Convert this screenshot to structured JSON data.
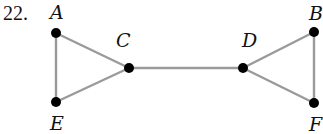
{
  "problem_number": "22.",
  "graph": {
    "nodes": [
      {
        "id": "A",
        "label": "A",
        "x": 56,
        "y": 33,
        "lx": 50,
        "ly": 19
      },
      {
        "id": "E",
        "label": "E",
        "x": 56,
        "y": 102,
        "lx": 50,
        "ly": 130
      },
      {
        "id": "C",
        "label": "C",
        "x": 129,
        "y": 68,
        "lx": 116,
        "ly": 47
      },
      {
        "id": "D",
        "label": "D",
        "x": 243,
        "y": 68,
        "lx": 242,
        "ly": 47
      },
      {
        "id": "B",
        "label": "B",
        "x": 314,
        "y": 32,
        "lx": 309,
        "ly": 20
      },
      {
        "id": "F",
        "label": "F",
        "x": 314,
        "y": 103,
        "lx": 309,
        "ly": 131
      }
    ],
    "edges": [
      [
        "A",
        "E"
      ],
      [
        "A",
        "C"
      ],
      [
        "E",
        "C"
      ],
      [
        "C",
        "D"
      ],
      [
        "D",
        "B"
      ],
      [
        "D",
        "F"
      ],
      [
        "B",
        "F"
      ]
    ],
    "edge_color": "#9a9a9a",
    "node_color": "#000000"
  }
}
